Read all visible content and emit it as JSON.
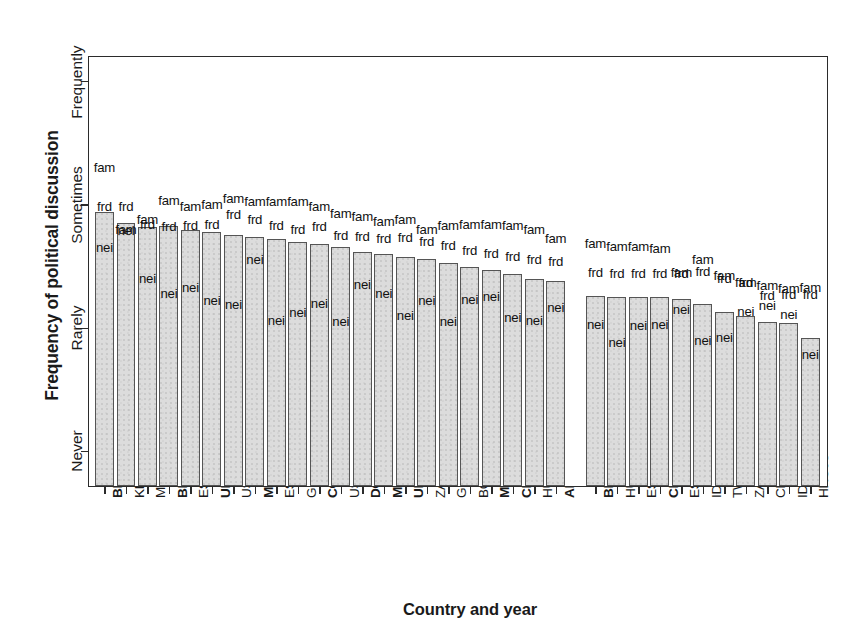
{
  "chart_data": {
    "type": "bar",
    "title": "",
    "xlabel": "Country and year",
    "ylabel": "Frequency of political discussion",
    "y_tick_labels": [
      "Never",
      "Rarely",
      "Sometimes",
      "Frequently"
    ],
    "y_tick_values": [
      1,
      2,
      3,
      4
    ],
    "ylim": [
      0.72,
      4.2
    ],
    "grid": false,
    "legend_position": "none",
    "series_names": [
      "fam",
      "frd",
      "nei"
    ],
    "series_description": {
      "fam": "Discussion with family",
      "frd": "Discussion with friends",
      "nei": "Discussion with neighbours"
    },
    "bar_value_meaning": "Bar height = overall frequency of political discussion (mean of fam/frd/nei markers)",
    "group_gap_after_category": "ARG07",
    "categories": [
      "BRA02",
      "KEN12",
      "MOZ04",
      "BRA06",
      "ESP11",
      "URY04",
      "USA04",
      "MEX12",
      "ESP15",
      "GRC04",
      "COL14",
      "USA12",
      "DOM10",
      "MEX18",
      "URY94",
      "ZAF09",
      "GRC96",
      "BGR96",
      "MEX06",
      "CHL00",
      "HUN98",
      "ARG07",
      "BRA14",
      "HUN06",
      "ESP93",
      "CHL93",
      "ESP04",
      "IDN04",
      "TWN04",
      "ZAF04",
      "CHN08",
      "IDN09",
      "HKG98"
    ],
    "categories_bold": [
      "BRA02",
      "BRA06",
      "URY04",
      "MEX12",
      "COL14",
      "DOM10",
      "MEX18",
      "URY94",
      "MEX06",
      "CHL00",
      "ARG07",
      "BRA14",
      "CHL93"
    ],
    "bar_values": [
      2.94,
      2.85,
      2.82,
      2.83,
      2.8,
      2.78,
      2.76,
      2.74,
      2.72,
      2.7,
      2.68,
      2.66,
      2.62,
      2.6,
      2.58,
      2.56,
      2.53,
      2.5,
      2.47,
      2.44,
      2.4,
      2.38,
      2.26,
      2.25,
      2.25,
      2.25,
      2.24,
      2.2,
      2.13,
      2.1,
      2.05,
      2.04,
      1.92
    ],
    "points": [
      {
        "cat": "BRA02",
        "fam": 3.3,
        "frd": 2.98,
        "nei": 2.65
      },
      {
        "cat": "KEN12",
        "fam": 2.8,
        "frd": 2.98,
        "nei": 2.79
      },
      {
        "cat": "MOZ04",
        "fam": 2.88,
        "frd": 2.84,
        "nei": 2.4
      },
      {
        "cat": "BRA06",
        "fam": 3.03,
        "frd": 2.82,
        "nei": 2.28
      },
      {
        "cat": "ESP11",
        "fam": 2.98,
        "frd": 2.83,
        "nei": 2.33
      },
      {
        "cat": "URY04",
        "fam": 3.0,
        "frd": 2.84,
        "nei": 2.22
      },
      {
        "cat": "USA04",
        "fam": 3.05,
        "frd": 2.92,
        "nei": 2.19
      },
      {
        "cat": "MEX12",
        "fam": 3.02,
        "frd": 2.88,
        "nei": 2.55
      },
      {
        "cat": "ESP15",
        "fam": 3.02,
        "frd": 2.83,
        "nei": 2.06
      },
      {
        "cat": "GRC04",
        "fam": 3.02,
        "frd": 2.8,
        "nei": 2.12
      },
      {
        "cat": "COL14",
        "fam": 2.98,
        "frd": 2.82,
        "nei": 2.2
      },
      {
        "cat": "USA12",
        "fam": 2.93,
        "frd": 2.75,
        "nei": 2.05
      },
      {
        "cat": "DOM10",
        "fam": 2.9,
        "frd": 2.74,
        "nei": 2.35
      },
      {
        "cat": "MEX18",
        "fam": 2.86,
        "frd": 2.72,
        "nei": 2.28
      },
      {
        "cat": "URY94",
        "fam": 2.88,
        "frd": 2.73,
        "nei": 2.1
      },
      {
        "cat": "ZAF09",
        "fam": 2.8,
        "frd": 2.7,
        "nei": 2.22
      },
      {
        "cat": "GRC96",
        "fam": 2.83,
        "frd": 2.67,
        "nei": 2.05
      },
      {
        "cat": "BGR96",
        "fam": 2.84,
        "frd": 2.63,
        "nei": 2.23
      },
      {
        "cat": "MEX06",
        "fam": 2.84,
        "frd": 2.6,
        "nei": 2.25
      },
      {
        "cat": "CHL00",
        "fam": 2.83,
        "frd": 2.58,
        "nei": 2.08
      },
      {
        "cat": "HUN98",
        "fam": 2.8,
        "frd": 2.55,
        "nei": 2.06
      },
      {
        "cat": "ARG07",
        "fam": 2.72,
        "frd": 2.54,
        "nei": 2.16
      },
      {
        "cat": "BRA14",
        "fam": 2.68,
        "frd": 2.45,
        "nei": 2.03
      },
      {
        "cat": "HUN06",
        "fam": 2.66,
        "frd": 2.44,
        "nei": 1.88
      },
      {
        "cat": "ESP93",
        "fam": 2.66,
        "frd": 2.44,
        "nei": 2.02
      },
      {
        "cat": "CHL93",
        "fam": 2.64,
        "frd": 2.44,
        "nei": 2.03
      },
      {
        "cat": "ESP04",
        "fam": 2.45,
        "frd": 2.44,
        "nei": 2.15
      },
      {
        "cat": "IDN04",
        "fam": 2.55,
        "frd": 2.46,
        "nei": 1.9
      },
      {
        "cat": "TWN04",
        "fam": 2.42,
        "frd": 2.4,
        "nei": 1.92
      },
      {
        "cat": "ZAF04",
        "fam": 2.37,
        "frd": 2.37,
        "nei": 2.13
      },
      {
        "cat": "CHN08",
        "fam": 2.34,
        "frd": 2.26,
        "nei": 2.18
      },
      {
        "cat": "IDN09",
        "fam": 2.32,
        "frd": 2.27,
        "nei": 2.11
      },
      {
        "cat": "HKG98",
        "fam": 2.33,
        "frd": 2.27,
        "nei": 1.78
      }
    ],
    "colors": {
      "bar_fill": "#dcdcdc",
      "bar_edge": "#555555",
      "axis": "#2b2b2b",
      "text": "#1a1a1a"
    }
  }
}
